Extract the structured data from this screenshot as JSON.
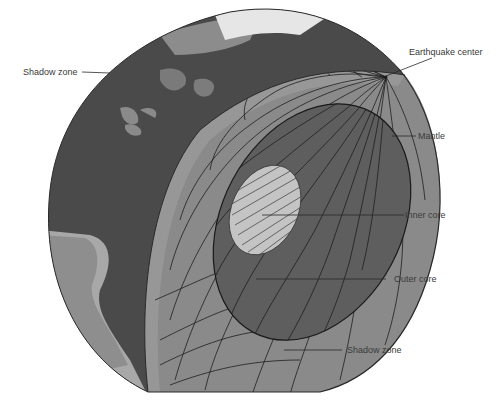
{
  "diagram": {
    "labels": {
      "shadow_zone_top": "Shadow zone",
      "earthquake_center": "Earthquake center",
      "mantle": "Mantle",
      "inner_core": "Inner core",
      "outer_core": "Outer core",
      "shadow_zone_bottom": "Shadow zone"
    },
    "colors": {
      "background": "#ffffff",
      "ocean_shadow": "#4a4a4a",
      "land": "#8c8c8c",
      "land_light": "#b0b0b0",
      "ice": "#e6e6e6",
      "mantle": "#8a8a8a",
      "outer_core": "#5e5e5e",
      "inner_core": "#c4c4c4",
      "wave_lines": "#1e1e1e",
      "label_text": "#3a3a3a"
    }
  }
}
